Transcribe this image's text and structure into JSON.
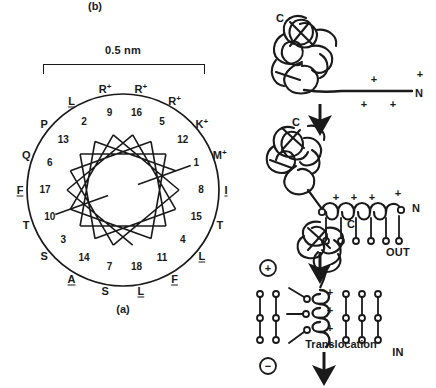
{
  "figure": {
    "panel_a_caption": "(a)",
    "panel_b_caption": "(b)",
    "scale_label": "0.5 nm"
  },
  "chart_data": {
    "type": "scatter",
    "subtitle": "Residues plotted at 100° per residue around a helical wheel; diameter marked 0.5 nm",
    "xlabel": "",
    "ylabel": "",
    "scale_bar": "0.5 nm",
    "residues_per_turn": 3.6,
    "degrees_per_residue": 100,
    "n_residues": 18,
    "legend_position": "none",
    "grid": false,
    "annotations": [
      "0.5 nm",
      "(a)"
    ],
    "categories": [
      "1",
      "2",
      "3",
      "4",
      "5",
      "6",
      "7",
      "8",
      "9",
      "10",
      "11",
      "12",
      "13",
      "14",
      "15",
      "16",
      "17",
      "18"
    ],
    "residues": [
      {
        "position": 1,
        "code": "M",
        "charge": "+",
        "label": "M+",
        "hydrophobic": false,
        "angle_deg": 70
      },
      {
        "position": 2,
        "code": "L",
        "charge": "",
        "label": "L",
        "hydrophobic": true,
        "angle_deg": 330
      },
      {
        "position": 3,
        "code": "S",
        "charge": "",
        "label": "S",
        "hydrophobic": false,
        "angle_deg": 230
      },
      {
        "position": 4,
        "code": "L",
        "charge": "",
        "label": "L",
        "hydrophobic": true,
        "angle_deg": 130
      },
      {
        "position": 5,
        "code": "R",
        "charge": "+",
        "label": "R+",
        "hydrophobic": false,
        "angle_deg": 30
      },
      {
        "position": 6,
        "code": "Q",
        "charge": "",
        "label": "Q",
        "hydrophobic": false,
        "angle_deg": 290
      },
      {
        "position": 7,
        "code": "S",
        "charge": "",
        "label": "S",
        "hydrophobic": false,
        "angle_deg": 190
      },
      {
        "position": 8,
        "code": "I",
        "charge": "",
        "label": "I",
        "hydrophobic": true,
        "angle_deg": 90
      },
      {
        "position": 9,
        "code": "R",
        "charge": "+",
        "label": "R+",
        "hydrophobic": false,
        "angle_deg": 350
      },
      {
        "position": 10,
        "code": "T",
        "charge": "",
        "label": "T",
        "hydrophobic": false,
        "angle_deg": 250
      },
      {
        "position": 11,
        "code": "F",
        "charge": "",
        "label": "F",
        "hydrophobic": true,
        "angle_deg": 150
      },
      {
        "position": 12,
        "code": "K",
        "charge": "+",
        "label": "K+",
        "hydrophobic": false,
        "angle_deg": 50
      },
      {
        "position": 13,
        "code": "P",
        "charge": "",
        "label": "P",
        "hydrophobic": false,
        "angle_deg": 310
      },
      {
        "position": 14,
        "code": "A",
        "charge": "",
        "label": "A",
        "hydrophobic": true,
        "angle_deg": 210
      },
      {
        "position": 15,
        "code": "T",
        "charge": "",
        "label": "T",
        "hydrophobic": false,
        "angle_deg": 110
      },
      {
        "position": 16,
        "code": "R",
        "charge": "+",
        "label": "R+",
        "hydrophobic": false,
        "angle_deg": 10
      },
      {
        "position": 17,
        "code": "F",
        "charge": "",
        "label": "F",
        "hydrophobic": true,
        "angle_deg": 270
      },
      {
        "position": 18,
        "code": "L",
        "charge": "",
        "label": "L",
        "hydrophobic": true,
        "angle_deg": 170
      }
    ]
  },
  "panel_b": {
    "stage1": {
      "c_terminus": "C",
      "n_terminus": "N",
      "charges": [
        "+",
        "+",
        "+",
        "+",
        "+"
      ]
    },
    "stage2": {
      "c_terminus": "C",
      "n_terminus": "N",
      "charges": [
        "+",
        "+",
        "+",
        "+"
      ]
    },
    "stage3": {
      "c_terminus": "C",
      "out_label": "OUT",
      "in_label": "IN",
      "positive_pole": "+",
      "negative_pole": "−",
      "charges": [
        "+",
        "+",
        "+",
        "+"
      ],
      "translocation_label": "Translocation"
    }
  }
}
